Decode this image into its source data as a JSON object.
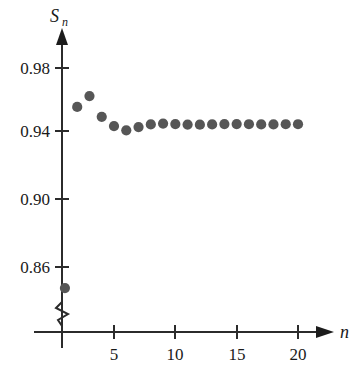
{
  "chart_data": {
    "type": "scatter",
    "title": "",
    "subtitle": "",
    "xlabel": "n",
    "ylabel": "S_n",
    "ylabel_main": "S",
    "ylabel_sub": "n",
    "xlim": [
      0,
      21.5
    ],
    "ylim": [
      0.835,
      0.995
    ],
    "y_axis_break": true,
    "grid": false,
    "legend": null,
    "x_ticks": [
      5,
      10,
      15,
      20
    ],
    "x_tick_labels": [
      "5",
      "10",
      "15",
      "20"
    ],
    "y_ticks": [
      0.86,
      0.9,
      0.94,
      0.98
    ],
    "y_tick_labels": [
      "0.86",
      "0.90",
      "0.94",
      "0.98"
    ],
    "point_color": "#565656",
    "axis_color": "#2b2b2b",
    "x": [
      1,
      2,
      3,
      4,
      5,
      6,
      7,
      8,
      9,
      10,
      11,
      12,
      13,
      14,
      15,
      16,
      17,
      18,
      19,
      20
    ],
    "values": [
      0.8403,
      0.9553,
      0.9622,
      0.949,
      0.9431,
      0.9404,
      0.9425,
      0.9442,
      0.9447,
      0.9444,
      0.9441,
      0.944,
      0.9442,
      0.9444,
      0.9444,
      0.9443,
      0.9442,
      0.9442,
      0.9443,
      0.9443
    ],
    "series": [
      {
        "name": "S_n",
        "values": [
          0.8403,
          0.9553,
          0.9622,
          0.949,
          0.9431,
          0.9404,
          0.9425,
          0.9442,
          0.9447,
          0.9444,
          0.9441,
          0.944,
          0.9442,
          0.9444,
          0.9444,
          0.9443,
          0.9442,
          0.9442,
          0.9443,
          0.9443
        ]
      }
    ]
  }
}
